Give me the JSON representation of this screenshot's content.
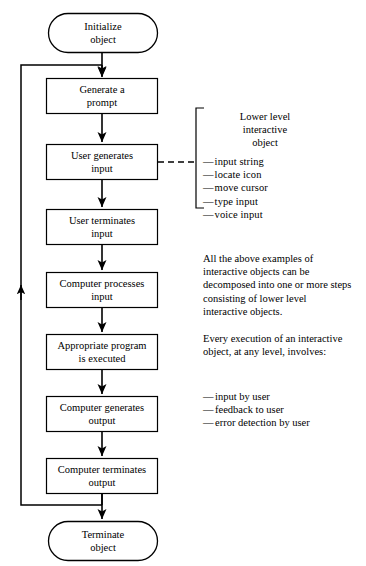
{
  "diagram": {
    "line_color": "#000000",
    "fill_color": "#ffffff",
    "nodes": [
      {
        "id": "initialize",
        "shape": "terminator",
        "label": "Initialize\nobject"
      },
      {
        "id": "generate-prompt",
        "shape": "process",
        "label": "Generate a\nprompt"
      },
      {
        "id": "user-generates",
        "shape": "process",
        "label": "User generates\ninput"
      },
      {
        "id": "user-terminates",
        "shape": "process",
        "label": "User terminates\ninput"
      },
      {
        "id": "computer-processes",
        "shape": "process",
        "label": "Computer processes\ninput"
      },
      {
        "id": "program-executed",
        "shape": "process",
        "label": "Appropriate program\nis executed"
      },
      {
        "id": "computer-generates",
        "shape": "process",
        "label": "Computer generates\noutput"
      },
      {
        "id": "computer-terminates",
        "shape": "process",
        "label": "Computer terminates\noutput"
      },
      {
        "id": "terminate",
        "shape": "terminator",
        "label": "Terminate\nobject"
      }
    ]
  },
  "annotations": {
    "bracket": {
      "heading": "Lower level\ninteractive\nobject",
      "items": [
        "input string",
        "locate  icon",
        "move cursor",
        "type input",
        "voice  input"
      ],
      "item_dash": "—"
    },
    "paragraphs": [
      "All the above examples of interactive objects can be decomposed into one or more steps consisting of lower level interactive objects.",
      "Every execution of an interactive object, at any level, involves:"
    ],
    "involves": {
      "dash": "—",
      "items": [
        "input by user",
        "feedback to user",
        "error detection by user"
      ]
    }
  }
}
